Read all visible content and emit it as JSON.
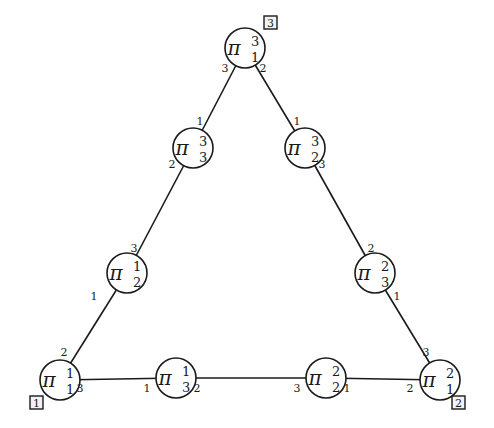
{
  "diagram": {
    "title": "",
    "symbol": "π",
    "nodes": [
      {
        "id": "pi_1_3",
        "sup": "3",
        "sub": "1",
        "cx": 245,
        "cy": 48
      },
      {
        "id": "pi_3_3",
        "sup": "3",
        "sub": "3",
        "cx": 193,
        "cy": 148
      },
      {
        "id": "pi_2_3",
        "sup": "3",
        "sub": "2",
        "cx": 305,
        "cy": 148
      },
      {
        "id": "pi_2_1",
        "sup": "1",
        "sub": "2",
        "cx": 127,
        "cy": 273
      },
      {
        "id": "pi_3_2",
        "sup": "2",
        "sub": "3",
        "cx": 375,
        "cy": 273
      },
      {
        "id": "pi_1_1",
        "sup": "1",
        "sub": "1",
        "cx": 60,
        "cy": 380
      },
      {
        "id": "pi_3_1",
        "sup": "1",
        "sub": "3",
        "cx": 176,
        "cy": 378
      },
      {
        "id": "pi_2_2",
        "sup": "2",
        "sub": "2",
        "cx": 326,
        "cy": 378
      },
      {
        "id": "pi_1_2",
        "sup": "2",
        "sub": "1",
        "cx": 440,
        "cy": 380
      }
    ],
    "edges": [
      {
        "from": "pi_1_3",
        "to": "pi_3_3"
      },
      {
        "from": "pi_3_3",
        "to": "pi_2_1"
      },
      {
        "from": "pi_2_1",
        "to": "pi_1_1"
      },
      {
        "from": "pi_1_1",
        "to": "pi_3_1"
      },
      {
        "from": "pi_3_1",
        "to": "pi_2_2"
      },
      {
        "from": "pi_2_2",
        "to": "pi_1_2"
      },
      {
        "from": "pi_1_2",
        "to": "pi_3_2"
      },
      {
        "from": "pi_3_2",
        "to": "pi_2_3"
      },
      {
        "from": "pi_2_3",
        "to": "pi_1_3"
      }
    ],
    "port_labels": [
      {
        "text": "3",
        "x": 225,
        "y": 72
      },
      {
        "text": "2",
        "x": 263,
        "y": 72
      },
      {
        "text": "1",
        "x": 200,
        "y": 125
      },
      {
        "text": "2",
        "x": 172,
        "y": 168
      },
      {
        "text": "1",
        "x": 297,
        "y": 125
      },
      {
        "text": "3",
        "x": 322,
        "y": 168
      },
      {
        "text": "3",
        "x": 134,
        "y": 252
      },
      {
        "text": "1",
        "x": 94,
        "y": 300
      },
      {
        "text": "2",
        "x": 371,
        "y": 252
      },
      {
        "text": "1",
        "x": 397,
        "y": 300
      },
      {
        "text": "2",
        "x": 64,
        "y": 356
      },
      {
        "text": "3",
        "x": 80,
        "y": 392
      },
      {
        "text": "1",
        "x": 147,
        "y": 392
      },
      {
        "text": "2",
        "x": 197,
        "y": 392
      },
      {
        "text": "3",
        "x": 297,
        "y": 392
      },
      {
        "text": "1",
        "x": 347,
        "y": 392
      },
      {
        "text": "3",
        "x": 426,
        "y": 356
      },
      {
        "text": "2",
        "x": 410,
        "y": 392
      }
    ],
    "corner_boxes": [
      {
        "label": "3",
        "x": 264,
        "y": 16
      },
      {
        "label": "1",
        "x": 30,
        "y": 396
      },
      {
        "label": "2",
        "x": 452,
        "y": 396
      }
    ]
  }
}
